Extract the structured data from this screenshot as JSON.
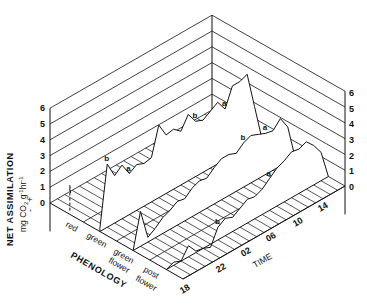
{
  "chart_data": {
    "type": "line",
    "subtype": "3d-profile",
    "title": "",
    "zlabel": "NET ASSIMILATION",
    "zunits": "mg CO2 g⁻¹hr⁻¹",
    "zlabel_line2": "mg CO₂ g⁻¹hr⁻¹",
    "zlabel_sign": "+ -",
    "xlabel": "TIME",
    "ylabel": "PHENOLOGY",
    "zlim": [
      0,
      6
    ],
    "z_ticks": [
      "0",
      "1",
      "2",
      "3",
      "4",
      "5",
      "6"
    ],
    "time_ticks": [
      "18",
      "22",
      "02",
      "06",
      "10",
      "14"
    ],
    "phenology_categories": [
      "red",
      "green",
      "green flower",
      "post flower"
    ],
    "time_hours": [
      18,
      19,
      20,
      21,
      22,
      23,
      0,
      1,
      2,
      3,
      4,
      5,
      6,
      7,
      8,
      9,
      10,
      11,
      12,
      13,
      14,
      15,
      16
    ],
    "series": [
      {
        "name": "red",
        "values": [
          0,
          0,
          0,
          0,
          0,
          0,
          0,
          0,
          0,
          0,
          0,
          0,
          0,
          0,
          0,
          0,
          0,
          0,
          0,
          0,
          0,
          0,
          0
        ],
        "style": "dashed",
        "note": "short segment near start"
      },
      {
        "name": "green",
        "values": [
          0.2,
          4.0,
          3.0,
          3.4,
          2.6,
          2.9,
          2.7,
          2.8,
          4.6,
          3.7,
          3.8,
          3.4,
          4.2,
          3.5,
          3.3,
          3.6,
          3.9,
          3.2,
          4.4,
          4.4,
          4.6,
          2.3,
          0
        ],
        "markers": [
          {
            "label": "b",
            "index": 1
          },
          {
            "label": "a",
            "index": 4
          },
          {
            "label": "b",
            "index": 13
          },
          {
            "label": "a",
            "index": 17
          }
        ]
      },
      {
        "name": "green flower",
        "values": [
          0,
          2.2,
          0.3,
          0.6,
          1.0,
          1.2,
          1.5,
          1.4,
          1.8,
          2.0,
          1.9,
          2.3,
          2.6,
          2.6,
          2.4,
          2.8,
          3.0,
          2.8,
          2.6,
          2.5,
          3.0,
          2.2,
          0
        ],
        "markers": [
          {
            "label": "b",
            "index": 15
          },
          {
            "label": "a",
            "index": 18
          }
        ]
      },
      {
        "name": "post flower",
        "values": [
          0,
          0.2,
          0,
          0.7,
          0.1,
          0,
          -0.2,
          0.8,
          1.1,
          0.9,
          1.2,
          1.5,
          1.4,
          1.6,
          2.0,
          2.4,
          2.6,
          2.9,
          2.8,
          3.0,
          2.5,
          1.8,
          0
        ],
        "markers": [
          {
            "label": "b",
            "index": 7
          },
          {
            "label": "a",
            "index": 14
          }
        ]
      }
    ],
    "grid": true,
    "legend": "none"
  },
  "axis_labels": {
    "z_title": "NET ASSIMILATION",
    "z_units": "mg CO2 g-1hr-1",
    "time_title": "TIME",
    "phenology_title": "PHENOLOGY",
    "phen": [
      "red",
      "green",
      "green",
      "flower",
      "post",
      "flower"
    ],
    "z_left": [
      "0",
      "1",
      "2",
      "3",
      "4",
      "5",
      "6"
    ],
    "z_right": [
      "0",
      "1",
      "2",
      "3",
      "4",
      "5",
      "6"
    ],
    "time": [
      "18",
      "22",
      "02",
      "06",
      "10",
      "14"
    ],
    "sign_plus": "+",
    "sign_minus": "-"
  }
}
